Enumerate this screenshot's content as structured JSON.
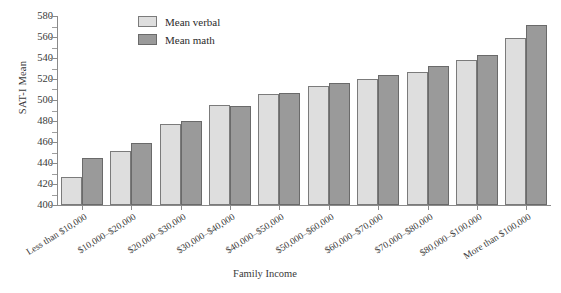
{
  "chart_data": {
    "type": "bar",
    "title": "",
    "xlabel": "Family Income",
    "ylabel": "SAT-I Mean",
    "ylim": [
      400,
      580
    ],
    "ytick_step": 20,
    "yminor_step": 10,
    "grid": false,
    "legend_position": "top-center",
    "categories": [
      "Less than $10,000",
      "$10,000–$20,000",
      "$20,000–$30,000",
      "$30,000–$40,000",
      "$40,000–$50,000",
      "$50,000–$60,000",
      "$60,000–$70,000",
      "$70,000–$80,000",
      "$80,000–$100,000",
      "More than $100,000"
    ],
    "ytick_labels": [
      "400",
      "420",
      "440",
      "460",
      "480",
      "500",
      "520",
      "540",
      "560",
      "580"
    ],
    "series": [
      {
        "name": "Mean verbal",
        "color": "#dedede",
        "values": [
          427,
          451,
          477,
          495,
          506,
          513,
          520,
          527,
          538,
          559
        ]
      },
      {
        "name": "Mean math",
        "color": "#9a9a9a",
        "values": [
          445,
          459,
          480,
          494,
          507,
          516,
          524,
          532,
          543,
          571
        ]
      }
    ]
  },
  "legend": {
    "items": [
      {
        "label": "Mean verbal",
        "swatch": "verbal"
      },
      {
        "label": "Mean math",
        "swatch": "math"
      }
    ]
  },
  "axes": {
    "y_title": "SAT-I Mean",
    "x_title": "Family Income"
  }
}
